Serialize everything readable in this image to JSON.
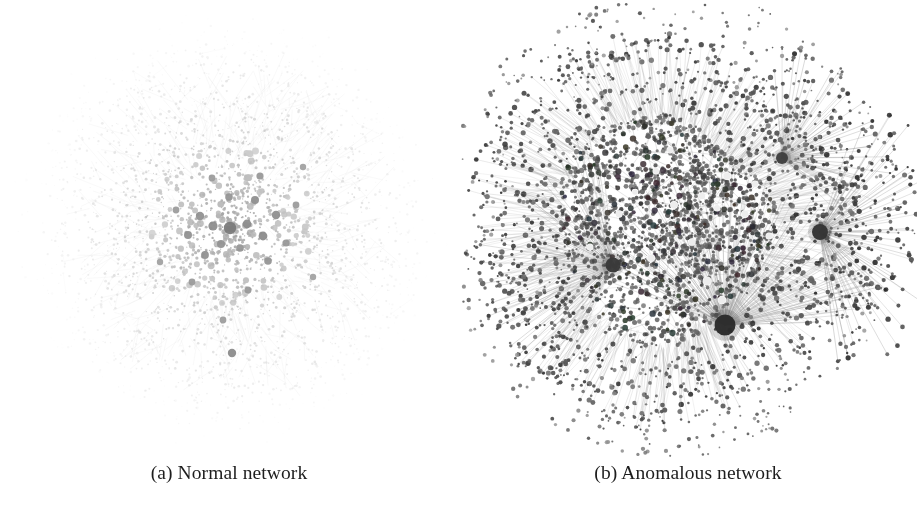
{
  "figure": {
    "background_color": "#ffffff",
    "width": 917,
    "height": 532,
    "panel_count": 2
  },
  "panels": [
    {
      "id": "a",
      "caption": "(a) Normal network",
      "label": "(a)",
      "title": "Normal network",
      "canvas": {
        "width": 458,
        "height": 460
      },
      "graph": {
        "layout": "radial-scatter",
        "center": [
          230,
          228
        ],
        "core_radius": 86,
        "halo_radius": 196,
        "node_count": 2600,
        "edge_count": 2150,
        "hub_count": 0,
        "core_node_color": "#8d8d8d",
        "hub_node_color": "#6f6f6f",
        "leaf_node_color": "#c9c9c9",
        "edge_color": "#b8b8b8",
        "edge_opacity": 0.3,
        "density": "diffuse",
        "description": "Uniform radially decaying cloud of small nodes with a loose grey core of mid-sized hubs; no dominant star hubs.",
        "prominent_nodes": [
          {
            "x": 230,
            "y": 228,
            "r": 6.2,
            "color": "#7a7a7a"
          },
          {
            "x": 213,
            "y": 226,
            "r": 4.6,
            "color": "#8c8c8c"
          },
          {
            "x": 247,
            "y": 224,
            "r": 4.4,
            "color": "#8c8c8c"
          },
          {
            "x": 200,
            "y": 216,
            "r": 4.2,
            "color": "#909090"
          },
          {
            "x": 263,
            "y": 236,
            "r": 4.4,
            "color": "#8a8a8a"
          },
          {
            "x": 221,
            "y": 244,
            "r": 4.0,
            "color": "#939393"
          },
          {
            "x": 240,
            "y": 248,
            "r": 3.8,
            "color": "#969696"
          },
          {
            "x": 188,
            "y": 235,
            "r": 4.0,
            "color": "#919191"
          },
          {
            "x": 276,
            "y": 215,
            "r": 4.2,
            "color": "#8e8e8e"
          },
          {
            "x": 255,
            "y": 200,
            "r": 4.0,
            "color": "#8f8f8f"
          },
          {
            "x": 229,
            "y": 197,
            "r": 3.8,
            "color": "#949494"
          },
          {
            "x": 205,
            "y": 255,
            "r": 3.9,
            "color": "#929292"
          },
          {
            "x": 268,
            "y": 261,
            "r": 3.8,
            "color": "#949494"
          },
          {
            "x": 286,
            "y": 243,
            "r": 3.6,
            "color": "#979797"
          },
          {
            "x": 176,
            "y": 210,
            "r": 3.4,
            "color": "#9b9b9b"
          },
          {
            "x": 260,
            "y": 176,
            "r": 3.6,
            "color": "#989898"
          },
          {
            "x": 212,
            "y": 178,
            "r": 3.4,
            "color": "#9c9c9c"
          },
          {
            "x": 296,
            "y": 205,
            "r": 3.4,
            "color": "#9a9a9a"
          },
          {
            "x": 192,
            "y": 282,
            "r": 3.4,
            "color": "#9a9a9a"
          },
          {
            "x": 248,
            "y": 290,
            "r": 3.5,
            "color": "#989898"
          },
          {
            "x": 232,
            "y": 353,
            "r": 4.2,
            "color": "#8a8a8a"
          },
          {
            "x": 223,
            "y": 320,
            "r": 3.4,
            "color": "#9c9c9c"
          },
          {
            "x": 303,
            "y": 167,
            "r": 3.2,
            "color": "#a0a0a0"
          },
          {
            "x": 160,
            "y": 262,
            "r": 3.2,
            "color": "#a0a0a0"
          },
          {
            "x": 313,
            "y": 277,
            "r": 3.2,
            "color": "#a2a2a2"
          }
        ]
      }
    },
    {
      "id": "b",
      "caption": "(b) Anomalous network",
      "label": "(b)",
      "title": "Anomalous network",
      "canvas": {
        "width": 458,
        "height": 460
      },
      "graph": {
        "layout": "hub-and-spoke",
        "center": [
          212,
          222
        ],
        "core_radius": 104,
        "halo_radius": 205,
        "node_count": 2900,
        "edge_count": 4200,
        "hub_count": 4,
        "core_node_color": "#5c5c5c",
        "hub_node_color": "#2e2e2e",
        "leaf_node_color": "#3a3a3a",
        "bright_node_color": "#ededed",
        "edge_color": "#6e6e6e",
        "edge_opacity": 0.42,
        "density": "dense",
        "description": "Dark, heavily-meshed core with four dominant star hubs emitting long radial spokes that terminate in small dark leaf nodes; isolated dark dots litter the periphery.",
        "hubs": [
          {
            "name": "bottom-hub",
            "x": 266,
            "y": 325,
            "r": 10.5,
            "spokes": 150,
            "spoke_length": 140,
            "angle_from": 200,
            "angle_to": 360,
            "color": "#2b2b2b"
          },
          {
            "name": "right-hub",
            "x": 361,
            "y": 232,
            "r": 8.0,
            "spokes": 105,
            "spoke_length": 120,
            "angle_from": -70,
            "angle_to": 85,
            "color": "#343434"
          },
          {
            "name": "left-hub",
            "x": 154,
            "y": 265,
            "r": 7.5,
            "spokes": 100,
            "spoke_length": 120,
            "angle_from": 115,
            "angle_to": 265,
            "color": "#3a3a3a"
          },
          {
            "name": "upper-right-hub",
            "x": 323,
            "y": 158,
            "r": 6.0,
            "spokes": 70,
            "spoke_length": 95,
            "angle_from": -95,
            "angle_to": 45,
            "color": "#3f3f3f"
          }
        ],
        "bright_nodes": [
          {
            "x": 215,
            "y": 205,
            "r": 3.4
          },
          {
            "x": 243,
            "y": 196,
            "r": 3.2
          },
          {
            "x": 197,
            "y": 171,
            "r": 3.0
          },
          {
            "x": 268,
            "y": 176,
            "r": 3.6
          },
          {
            "x": 160,
            "y": 214,
            "r": 3.2
          },
          {
            "x": 233,
            "y": 242,
            "r": 3.2
          },
          {
            "x": 258,
            "y": 208,
            "r": 3.0
          },
          {
            "x": 286,
            "y": 214,
            "r": 3.4
          },
          {
            "x": 296,
            "y": 184,
            "r": 3.0
          },
          {
            "x": 192,
            "y": 258,
            "r": 3.6
          },
          {
            "x": 131,
            "y": 247,
            "r": 3.0
          },
          {
            "x": 248,
            "y": 281,
            "r": 4.0
          },
          {
            "x": 263,
            "y": 300,
            "r": 3.8
          },
          {
            "x": 211,
            "y": 150,
            "r": 3.0
          },
          {
            "x": 176,
            "y": 192,
            "r": 2.8
          },
          {
            "x": 310,
            "y": 236,
            "r": 3.0
          }
        ]
      }
    }
  ],
  "style": {
    "caption_color": "#1d1d1d",
    "caption_font_size_px": 19.5
  }
}
